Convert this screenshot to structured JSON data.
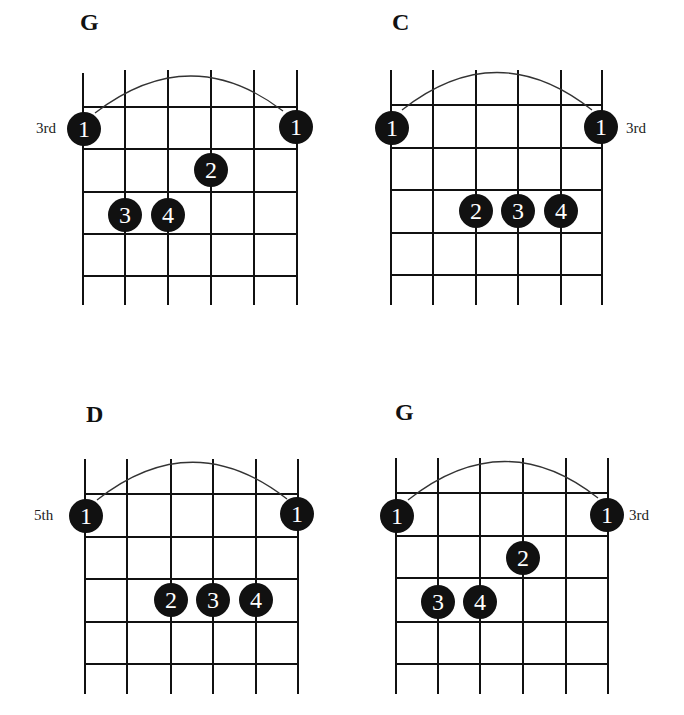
{
  "chords": [
    {
      "name": "G",
      "position_label": "3rd",
      "label_side": "left",
      "fingers": [
        {
          "finger": "1",
          "string": 1,
          "fret": 1
        },
        {
          "finger": "1",
          "string": 6,
          "fret": 1
        },
        {
          "finger": "2",
          "string": 4,
          "fret": 2
        },
        {
          "finger": "3",
          "string": 2,
          "fret": 3
        },
        {
          "finger": "4",
          "string": 3,
          "fret": 3
        }
      ],
      "barre": {
        "from_string": 1,
        "to_string": 6,
        "fret": 1
      }
    },
    {
      "name": "C",
      "position_label": "3rd",
      "label_side": "right",
      "fingers": [
        {
          "finger": "1",
          "string": 1,
          "fret": 1
        },
        {
          "finger": "1",
          "string": 6,
          "fret": 1
        },
        {
          "finger": "2",
          "string": 3,
          "fret": 3
        },
        {
          "finger": "3",
          "string": 4,
          "fret": 3
        },
        {
          "finger": "4",
          "string": 5,
          "fret": 3
        }
      ],
      "barre": {
        "from_string": 1,
        "to_string": 6,
        "fret": 1
      }
    },
    {
      "name": "D",
      "position_label": "5th",
      "label_side": "left",
      "fingers": [
        {
          "finger": "1",
          "string": 1,
          "fret": 1
        },
        {
          "finger": "1",
          "string": 6,
          "fret": 1
        },
        {
          "finger": "2",
          "string": 3,
          "fret": 3
        },
        {
          "finger": "3",
          "string": 4,
          "fret": 3
        },
        {
          "finger": "4",
          "string": 5,
          "fret": 3
        }
      ],
      "barre": {
        "from_string": 1,
        "to_string": 6,
        "fret": 1
      }
    },
    {
      "name": "G",
      "position_label": "3rd",
      "label_side": "right",
      "fingers": [
        {
          "finger": "1",
          "string": 1,
          "fret": 1
        },
        {
          "finger": "1",
          "string": 6,
          "fret": 1
        },
        {
          "finger": "2",
          "string": 4,
          "fret": 2
        },
        {
          "finger": "3",
          "string": 2,
          "fret": 3
        },
        {
          "finger": "4",
          "string": 3,
          "fret": 3
        }
      ],
      "barre": {
        "from_string": 1,
        "to_string": 6,
        "fret": 1
      }
    }
  ]
}
